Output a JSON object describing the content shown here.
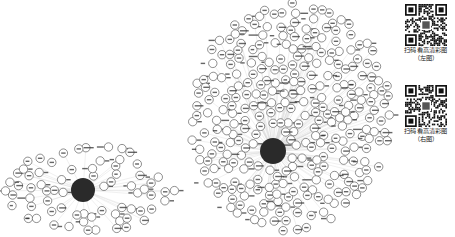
{
  "figure": {
    "type": "network-graph-pair",
    "background": "#ffffff",
    "node_fill": "#ffffff",
    "node_stroke": "#444444",
    "hub_fill": "#2a2a2a",
    "edge_color": "#d8d8d8",
    "label_color": "#333333"
  },
  "networks": [
    {
      "id": "left",
      "hub": {
        "x": 83,
        "y": 190,
        "r": 12,
        "label": "中心节点"
      },
      "region": {
        "x0": 5,
        "x1": 175,
        "y0": 145,
        "y1": 232
      },
      "node_count": 70,
      "seed": 7,
      "node_r": 4.2
    },
    {
      "id": "right",
      "hub": {
        "x": 273,
        "y": 151,
        "r": 13,
        "label": "中心节点"
      },
      "region": {
        "x0": 190,
        "x1": 392,
        "y0": 3,
        "y1": 232
      },
      "node_count": 300,
      "seed": 21,
      "node_r": 4.2
    }
  ],
  "qr_codes": [
    {
      "caption": "扫码看高清彩图",
      "sub": "（左图）"
    },
    {
      "caption": "扫码看高清彩图",
      "sub": "（右图）"
    }
  ]
}
